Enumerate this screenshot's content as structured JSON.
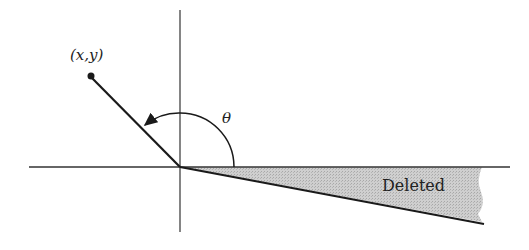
{
  "diagram": {
    "point_label": "(x,y)",
    "angle_label": "θ",
    "region_label": "Deleted",
    "colors": {
      "line": "#1a1a1a",
      "axis": "#333333",
      "shade": "#c8c8c8",
      "background": "#ffffff"
    },
    "geometry": {
      "origin": [
        180,
        167
      ],
      "point": [
        90,
        76
      ],
      "lower_ray_end": [
        484,
        224
      ],
      "horizontal_axis": [
        29,
        510
      ],
      "vertical_axis": [
        10,
        232
      ]
    }
  }
}
